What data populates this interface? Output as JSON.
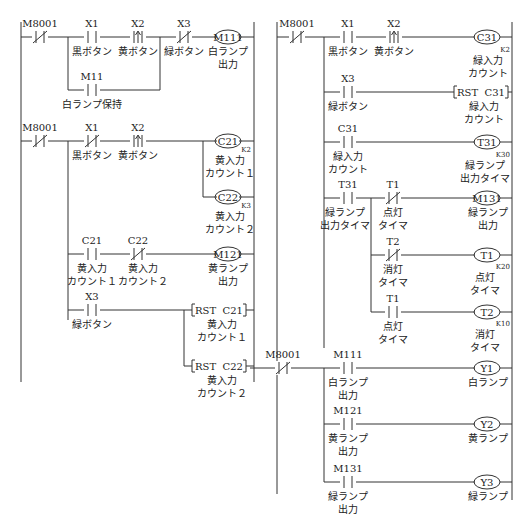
{
  "diagram": {
    "type": "ladder",
    "left_program": {
      "rungs": [
        {
          "contacts": [
            {
              "addr": "M8001",
              "kind": "nc",
              "label": ""
            },
            {
              "addr": "X1",
              "kind": "no",
              "label": "黒ボタン"
            },
            {
              "addr": "X2",
              "kind": "rising",
              "label": "黄ボタン"
            },
            {
              "addr": "X3",
              "kind": "nc",
              "label": "緑ボタン"
            }
          ],
          "branch": [
            {
              "addr": "M11",
              "kind": "no",
              "label": "白ランプ保持"
            }
          ],
          "coil": {
            "addr": "M111",
            "label1": "白ランプ",
            "label2": "出力"
          }
        },
        {
          "contacts": [
            {
              "addr": "M8001",
              "kind": "nc",
              "label": ""
            },
            {
              "addr": "X1",
              "kind": "nc",
              "label": "黒ボタン"
            },
            {
              "addr": "X2",
              "kind": "rising",
              "label": "黄ボタン"
            }
          ],
          "coils": [
            {
              "addr": "C21",
              "k": "K2",
              "label1": "黄入力",
              "label2": "カウント１"
            },
            {
              "addr": "C22",
              "k": "K3",
              "label1": "黄入力",
              "label2": "カウント２"
            }
          ]
        },
        {
          "contacts": [
            {
              "addr": "C21",
              "kind": "no",
              "label1": "黄入力",
              "label2": "カウント１"
            },
            {
              "addr": "C22",
              "kind": "nc",
              "label1": "黄入力",
              "label2": "カウント２"
            }
          ],
          "coil": {
            "addr": "M121",
            "label1": "黄ランプ",
            "label2": "出力"
          }
        },
        {
          "contacts": [
            {
              "addr": "X3",
              "kind": "no",
              "label": "緑ボタン"
            }
          ],
          "instructions": [
            {
              "text": "RST  C21",
              "label1": "黄入力",
              "label2": "カウント１"
            },
            {
              "text": "RST  C22",
              "label1": "黄入力",
              "label2": "カウント２"
            }
          ]
        }
      ]
    },
    "right_program": {
      "rungs": [
        {
          "contacts": [
            {
              "addr": "M8001",
              "kind": "nc"
            },
            {
              "addr": "X1",
              "kind": "no",
              "label": "黒ボタン"
            },
            {
              "addr": "X2",
              "kind": "rising",
              "label": "黄ボタン"
            }
          ],
          "coil": {
            "addr": "C31",
            "k": "K2",
            "label1": "緑入力",
            "label2": "カウント"
          }
        },
        {
          "contacts": [
            {
              "addr": "X3",
              "kind": "no",
              "label": "緑ボタン"
            }
          ],
          "instruction": {
            "text": "RST  C31",
            "label1": "緑入力",
            "label2": "カウント"
          }
        },
        {
          "contacts": [
            {
              "addr": "C31",
              "kind": "no",
              "label1": "緑入力",
              "label2": "カウント"
            }
          ],
          "coil": {
            "addr": "T31",
            "k": "K30",
            "label1": "緑ランプ",
            "label2": "出力タイマ"
          }
        },
        {
          "contacts": [
            {
              "addr": "T31",
              "kind": "no",
              "label1": "緑ランプ",
              "label2": "出力タイマ"
            },
            {
              "addr": "T1",
              "kind": "nc",
              "label1": "点灯",
              "label2": "タイマ"
            }
          ],
          "coil": {
            "addr": "M131",
            "label1": "緑ランプ",
            "label2": "出力"
          }
        },
        {
          "contacts": [
            {
              "addr": "T2",
              "kind": "nc",
              "label1": "消灯",
              "label2": "タイマ"
            }
          ],
          "coil": {
            "addr": "T1",
            "k": "K20",
            "label1": "点灯",
            "label2": "タイマ"
          }
        },
        {
          "contacts": [
            {
              "addr": "T1",
              "kind": "no",
              "label1": "点灯",
              "label2": "タイマ"
            }
          ],
          "coil": {
            "addr": "T2",
            "k": "K10",
            "label1": "消灯",
            "label2": "タイマ"
          }
        },
        {
          "contacts": [
            {
              "addr": "M8001",
              "kind": "nc"
            },
            {
              "addr": "M111",
              "kind": "no",
              "label1": "白ランプ",
              "label2": "出力"
            }
          ],
          "coil": {
            "addr": "Y1",
            "label": "白ランプ"
          }
        },
        {
          "contacts": [
            {
              "addr": "M121",
              "kind": "no",
              "label1": "黄ランプ",
              "label2": "出力"
            }
          ],
          "coil": {
            "addr": "Y2",
            "label": "黄ランプ"
          }
        },
        {
          "contacts": [
            {
              "addr": "M131",
              "kind": "no",
              "label1": "緑ランプ",
              "label2": "出力"
            }
          ],
          "coil": {
            "addr": "Y3",
            "label": "緑ランプ"
          }
        }
      ]
    }
  }
}
